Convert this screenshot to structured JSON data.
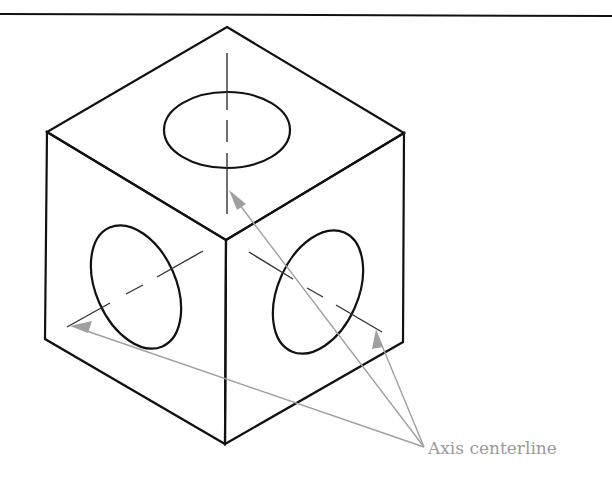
{
  "figure": {
    "annotation": {
      "label": "Axis centerline",
      "color": "#9a9a9a",
      "leader_origin": [
        424,
        447
      ],
      "arrow_targets": [
        {
          "face": "top",
          "tip": [
            229,
            190
          ]
        },
        {
          "face": "left",
          "tip": [
            70,
            326
          ]
        },
        {
          "face": "right",
          "tip": [
            376,
            329
          ]
        }
      ]
    },
    "colors": {
      "outline": "#111111",
      "centerline": "#333333",
      "leader": "#a0a0a0",
      "header_rule": "#111111"
    },
    "cube": {
      "vertices": {
        "top": [
          227,
          27
        ],
        "upper_left": [
          47,
          132
        ],
        "upper_right": [
          404,
          133
        ],
        "center": [
          226,
          240
        ],
        "lower_left": [
          45,
          339
        ],
        "lower_right": [
          403,
          342
        ],
        "bottom": [
          225,
          444
        ]
      }
    },
    "holes": [
      {
        "face": "top",
        "cx": 227,
        "cy": 130,
        "rx": 63,
        "ry": 38,
        "rotate": 0
      },
      {
        "face": "left",
        "cx": 136,
        "cy": 285,
        "rx": 38,
        "ry": 64,
        "rotate": -26
      },
      {
        "face": "right",
        "cx": 318,
        "cy": 292,
        "rx": 38,
        "ry": 64,
        "rotate": 26
      }
    ],
    "centerlines": [
      {
        "face": "top",
        "from": [
          227,
          53
        ],
        "to": [
          227,
          214
        ]
      },
      {
        "face": "left",
        "from": [
          67,
          327
        ],
        "to": [
          203,
          251
        ]
      },
      {
        "face": "right",
        "from": [
          249,
          252
        ],
        "to": [
          382,
          332
        ]
      }
    ]
  }
}
